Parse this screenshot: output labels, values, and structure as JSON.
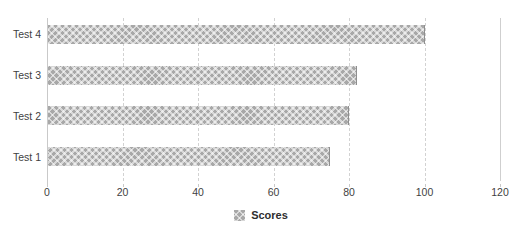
{
  "chart_data": {
    "type": "bar",
    "orientation": "horizontal",
    "title": "",
    "subtitle": "",
    "xlabel": "",
    "ylabel": "",
    "categories": [
      "Test 1",
      "Test 2",
      "Test 3",
      "Test 4"
    ],
    "series": [
      {
        "name": "Scores",
        "values": [
          75,
          80,
          82,
          100
        ]
      }
    ],
    "xlim": [
      0,
      120
    ],
    "xticks": [
      0,
      20,
      40,
      60,
      80,
      100,
      120
    ],
    "xtick_labels": [
      "0",
      "20",
      "40",
      "60",
      "80",
      "100",
      "120"
    ],
    "grid": true,
    "grid_axis": "x",
    "grid_style": "dashed",
    "legend": {
      "position": "bottom-center",
      "entries": [
        {
          "label": "Scores",
          "swatch": "hatch-crosshatch-gray"
        }
      ]
    },
    "colors": {
      "bar_fill": "#a8a8a8",
      "bar_edge": "#8f8f8f",
      "gridline": "#d2d2d2",
      "axis_line": "#c9c9c9",
      "text": "#3f3f3f",
      "background": "#ffffff"
    }
  },
  "legend": {
    "scores_label": "Scores"
  },
  "axis": {
    "y_labels": [
      "Test 4",
      "Test 3",
      "Test 2",
      "Test 1"
    ],
    "x_labels": [
      "0",
      "20",
      "40",
      "60",
      "80",
      "100",
      "120"
    ]
  }
}
